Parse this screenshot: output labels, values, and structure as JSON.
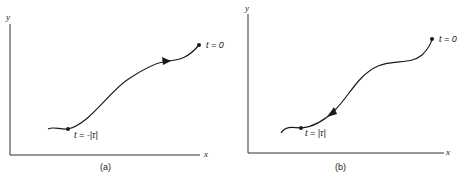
{
  "panels": [
    {
      "id": "a",
      "caption": "(a)",
      "axes": {
        "x_label": "x",
        "y_label": "y"
      },
      "start_label": "t = -|τ|",
      "end_label": "t = 0",
      "arrow_direction": "forward (toward t = 0)"
    },
    {
      "id": "b",
      "caption": "(b)",
      "axes": {
        "x_label": "x",
        "y_label": "y"
      },
      "start_label": "t = |τ|",
      "end_label": "t = 0",
      "arrow_direction": "backward (toward t = |τ|)"
    }
  ],
  "colors": {
    "ink": "#1a1a1a",
    "background": "#ffffff"
  }
}
